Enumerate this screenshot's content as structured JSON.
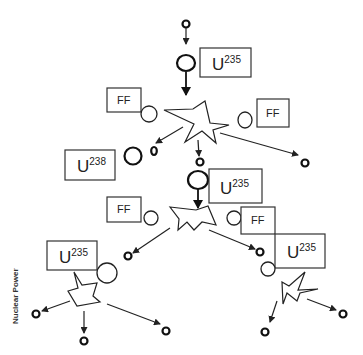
{
  "diagram": {
    "side_label": "Nuclear Power",
    "labels": {
      "u235_top": {
        "base": "U",
        "sup": "235"
      },
      "ff_top_left": "FF",
      "ff_top_right": "FF",
      "u238": {
        "base": "U",
        "sup": "238"
      },
      "u235_middle": {
        "base": "U",
        "sup": "235"
      },
      "ff_mid_left": "FF",
      "ff_mid_right": "FF",
      "u235_lower_left": {
        "base": "U",
        "sup": "235"
      },
      "u235_lower_right": {
        "base": "U",
        "sup": "235"
      }
    },
    "colors": {
      "stroke": "#222222",
      "background": "#ffffff"
    }
  }
}
